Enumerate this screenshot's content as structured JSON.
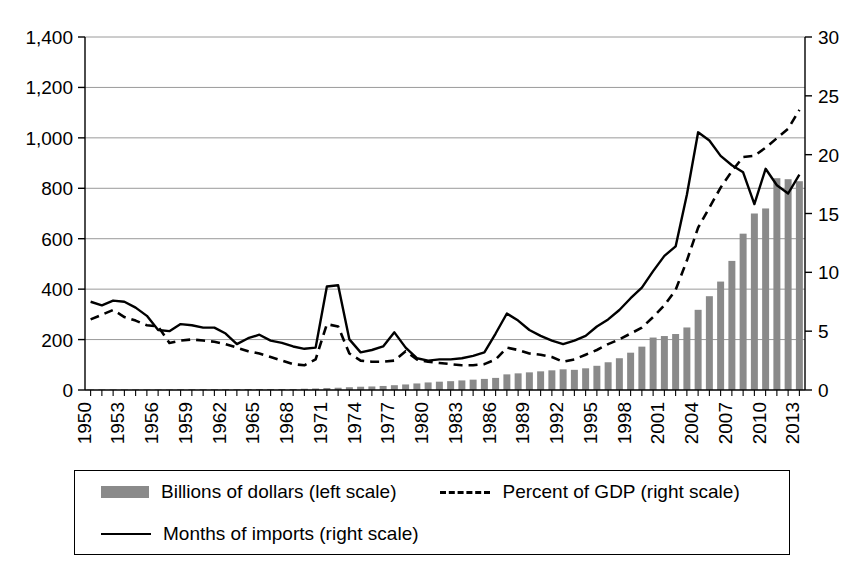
{
  "chart_data": {
    "type": "bar",
    "title": "",
    "subtitle": "",
    "xlabel": "",
    "ylabel": "",
    "grid": true,
    "legend_position": "bottom",
    "x": [
      1950,
      1951,
      1952,
      1953,
      1954,
      1955,
      1956,
      1957,
      1958,
      1959,
      1960,
      1961,
      1962,
      1963,
      1964,
      1965,
      1966,
      1967,
      1968,
      1969,
      1970,
      1971,
      1972,
      1973,
      1974,
      1975,
      1976,
      1977,
      1978,
      1979,
      1980,
      1981,
      1982,
      1983,
      1984,
      1985,
      1986,
      1987,
      1988,
      1989,
      1990,
      1991,
      1992,
      1993,
      1994,
      1995,
      1996,
      1997,
      1998,
      1999,
      2000,
      2001,
      2002,
      2003,
      2004,
      2005,
      2006,
      2007,
      2008,
      2009,
      2010,
      2011,
      2012,
      2013
    ],
    "xtick_labels": [
      "1950",
      "1953",
      "1956",
      "1959",
      "1962",
      "1965",
      "1968",
      "1971",
      "1974",
      "1977",
      "1980",
      "1983",
      "1986",
      "1989",
      "1992",
      "1995",
      "1998",
      "2001",
      "2004",
      "2007",
      "2010",
      "2013"
    ],
    "xtick_step_years": 3,
    "left_axis": {
      "label": "Billions of dollars",
      "ylim": [
        0,
        1400
      ],
      "ticks": [
        0,
        200,
        400,
        600,
        800,
        1000,
        1200,
        1400
      ],
      "tick_labels": [
        "0",
        "200",
        "400",
        "600",
        "800",
        "1,000",
        "1,200",
        "1,400"
      ]
    },
    "right_axis": {
      "label": "Percent / Months",
      "ylim": [
        0,
        30
      ],
      "ticks": [
        0,
        5,
        10,
        15,
        20,
        25,
        30
      ],
      "tick_labels": [
        "0",
        "5",
        "10",
        "15",
        "20",
        "25",
        "30"
      ]
    },
    "series": [
      {
        "name": "Billions of dollars (left scale)",
        "type": "bar",
        "axis": "left",
        "color": "#8a8a8a",
        "values": [
          2,
          2,
          2,
          2,
          2,
          2,
          2,
          2,
          3,
          3,
          3,
          3,
          3,
          3,
          4,
          4,
          4,
          4,
          4,
          5,
          6,
          8,
          9,
          11,
          13,
          14,
          16,
          19,
          22,
          26,
          30,
          33,
          35,
          38,
          41,
          44,
          48,
          62,
          66,
          70,
          74,
          78,
          82,
          80,
          86,
          96,
          110,
          126,
          148,
          172,
          208,
          214,
          222,
          248,
          318,
          372,
          430,
          512,
          620,
          700,
          720,
          840,
          836,
          828
        ],
        "notes": "Official reserve assets / foreign exchange holdings; rises steeply after 1998, peaking near 1,270 in 2011 and 1,245 in 2013."
      },
      {
        "name": "Percent of GDP (right scale)",
        "type": "line",
        "linestyle": "dashed",
        "axis": "right",
        "color": "#000000",
        "values": [
          6.0,
          6.4,
          6.8,
          6.2,
          5.9,
          5.5,
          5.4,
          4.0,
          4.2,
          4.3,
          4.2,
          4.1,
          3.9,
          3.6,
          3.3,
          3.1,
          2.8,
          2.5,
          2.2,
          2.1,
          2.6,
          5.6,
          5.4,
          3.1,
          2.5,
          2.4,
          2.4,
          2.5,
          3.3,
          2.6,
          2.4,
          2.3,
          2.2,
          2.1,
          2.1,
          2.2,
          2.6,
          3.6,
          3.4,
          3.1,
          3.0,
          2.8,
          2.4,
          2.6,
          3.0,
          3.4,
          3.9,
          4.3,
          4.8,
          5.3,
          6.2,
          7.2,
          8.5,
          11.0,
          13.8,
          15.5,
          17.2,
          18.6,
          19.8,
          19.9,
          20.6,
          21.4,
          22.2,
          23.8
        ],
        "notes": "Dashed line; parallels bars in billions relative to GDP, peaks at roughly 24 percent in 2013."
      },
      {
        "name": "Months of imports (right scale)",
        "type": "line",
        "linestyle": "solid",
        "axis": "right",
        "color": "#000000",
        "values": [
          7.5,
          7.2,
          7.6,
          7.5,
          7.0,
          6.3,
          5.1,
          5.0,
          5.6,
          5.5,
          5.3,
          5.3,
          4.8,
          3.9,
          4.4,
          4.7,
          4.2,
          4.0,
          3.7,
          3.5,
          3.6,
          8.8,
          8.9,
          4.3,
          3.2,
          3.4,
          3.7,
          4.9,
          3.6,
          2.7,
          2.5,
          2.6,
          2.6,
          2.7,
          2.9,
          3.2,
          4.8,
          6.5,
          5.9,
          5.1,
          4.6,
          4.2,
          3.9,
          4.2,
          4.6,
          5.4,
          6.0,
          6.8,
          7.8,
          8.7,
          10.1,
          11.4,
          12.2,
          16.6,
          21.9,
          21.2,
          19.9,
          19.1,
          18.5,
          15.8,
          18.8,
          17.4,
          16.7,
          18.3
        ],
        "notes": "Solid line; spikes to ~8.9 months in 1971-72, local peak ~6.5 in 1987, maximum ~22 months in 2004, ends near 18 in 2013."
      }
    ]
  },
  "legend": {
    "items": [
      {
        "marker": "bar-swatch",
        "label": "Billions of dollars (left scale)"
      },
      {
        "marker": "dashed-line-swatch",
        "label": "Percent of GDP (right scale)"
      },
      {
        "marker": "solid-line-swatch",
        "label": "Months of imports (right scale)"
      }
    ]
  },
  "colors": {
    "bar": "#8a8a8a",
    "line": "#000000",
    "grid": "#9a9a9a",
    "axis": "#000000",
    "background": "#ffffff"
  }
}
